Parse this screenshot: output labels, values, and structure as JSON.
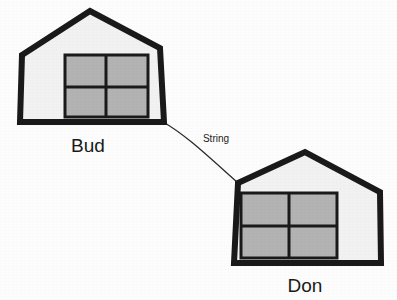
{
  "canvas": {
    "width": 397,
    "height": 300,
    "background_color": "#fdfdfd",
    "title": "Two houses connected by a string"
  },
  "style": {
    "outline_color": "#1a1a1a",
    "house_fill_color": "#f2f2f2",
    "window_fill_color": "#b3b3b3",
    "window_frame_color": "#1a1a1a",
    "string_color": "#2b2b2b",
    "label_color": "#1a1a1a",
    "house_outline_width": 6,
    "window_frame_width": 3,
    "mullion_width": 3,
    "string_width": 1.3
  },
  "houses": [
    {
      "id": "house-bud",
      "label": "Bud",
      "label_position": {
        "x": 88,
        "y": 152
      },
      "outline_points": "22,55 90,11 160,48 164,122 20,122",
      "window": {
        "x": 65,
        "y": 55,
        "width": 83,
        "height": 62,
        "mullion_vertical_x": 106,
        "mullion_horizontal_y": 87
      }
    },
    {
      "id": "house-don",
      "label": "Don",
      "label_position": {
        "x": 305,
        "y": 292
      },
      "outline_points": "238,183 305,152 380,192 381,263 234,263",
      "window": {
        "x": 241,
        "y": 193,
        "width": 96,
        "height": 65,
        "mullion_vertical_x": 289,
        "mullion_horizontal_y": 226
      }
    }
  ],
  "string": {
    "label": "String",
    "label_position": {
      "x": 216,
      "y": 142
    },
    "path": "M163,122 C185,134 212,160 238,183",
    "start_point": {
      "x": 163,
      "y": 122
    },
    "end_point": {
      "x": 238,
      "y": 183
    }
  }
}
